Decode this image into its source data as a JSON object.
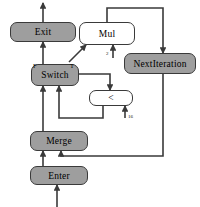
{
  "diagram": {
    "background_color": "#ffffff",
    "node_fill_gray": "#9e9e9e",
    "node_fill_white": "#ffffff",
    "edge_color": "#3a3a3a",
    "nodes": [
      {
        "id": "exit",
        "label": "Exit",
        "style": "filled"
      },
      {
        "id": "mul",
        "label": "Mul",
        "style": "open"
      },
      {
        "id": "nextiteration",
        "label": "NextIteration",
        "style": "filled"
      },
      {
        "id": "switch",
        "label": "Switch",
        "style": "filled"
      },
      {
        "id": "less",
        "label": "<",
        "style": "open"
      },
      {
        "id": "merge",
        "label": "Merge",
        "style": "filled"
      },
      {
        "id": "enter",
        "label": "Enter",
        "style": "filled"
      }
    ],
    "ports": [
      {
        "id": "switch-false",
        "label": "F",
        "node": "switch"
      },
      {
        "id": "switch-true",
        "label": "T",
        "node": "switch"
      }
    ],
    "edge_labels": [
      {
        "id": "mul-constant-input",
        "label": "2"
      },
      {
        "id": "less-constant-input",
        "label": "16"
      }
    ]
  }
}
